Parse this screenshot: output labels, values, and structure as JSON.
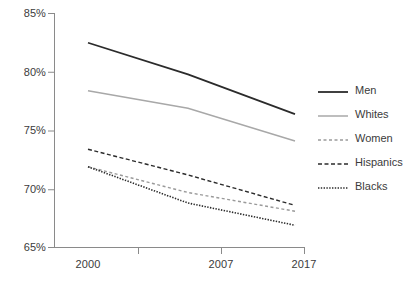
{
  "chart_data": {
    "type": "line",
    "title": "",
    "subtitle": "",
    "xlabel": "",
    "ylabel": "",
    "x": [
      "2000",
      "2007",
      "2017"
    ],
    "categories": [
      "2000",
      "2007",
      "2017"
    ],
    "xtick_labels": [
      "2000",
      "2007",
      "2017"
    ],
    "ytick_labels": [
      "85%",
      "80%",
      "75%",
      "70%",
      "65%"
    ],
    "ytick_values": [
      85,
      80,
      75,
      70,
      65
    ],
    "ylim": [
      65,
      85
    ],
    "grid": false,
    "legend_position": "right",
    "series": [
      {
        "name": "Men",
        "values": [
          82.5,
          79.8,
          76.4
        ],
        "color": "#2b2b2b",
        "style": "solid",
        "width": 1.8
      },
      {
        "name": "Whites",
        "values": [
          78.4,
          76.9,
          74.1
        ],
        "color": "#a8a8a8",
        "style": "solid",
        "width": 1.5
      },
      {
        "name": "Women",
        "values": [
          71.9,
          69.7,
          68.1
        ],
        "color": "#9a9a9a",
        "style": "dashed-small",
        "width": 1.4
      },
      {
        "name": "Hispanics",
        "values": [
          73.4,
          71.2,
          68.6
        ],
        "color": "#2b2b2b",
        "style": "dashed",
        "width": 1.4
      },
      {
        "name": "Blacks",
        "values": [
          71.9,
          68.8,
          66.9
        ],
        "color": "#2b2b2b",
        "style": "dotted",
        "width": 1.6
      }
    ]
  },
  "axes": {
    "y_labels": [
      "85%",
      "80%",
      "75%",
      "70%",
      "65%"
    ],
    "x_labels": [
      "2000",
      "2007",
      "2017"
    ],
    "axis_color": "#8a8a8a"
  },
  "legend": {
    "items": [
      {
        "label": "Men"
      },
      {
        "label": "Whites"
      },
      {
        "label": "Women"
      },
      {
        "label": "Hispanics"
      },
      {
        "label": "Blacks"
      }
    ]
  }
}
